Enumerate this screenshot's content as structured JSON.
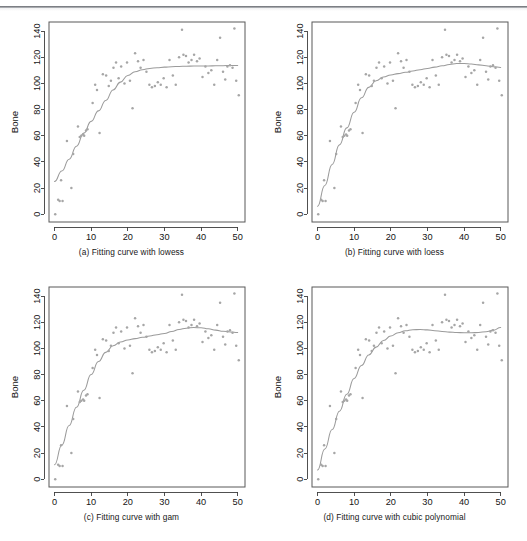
{
  "figure": {
    "panels": [
      {
        "id": "a",
        "caption": "(a) Fitting curve with lowess",
        "xlabel": "Age",
        "ylabel": "Bone",
        "method": "lowess"
      },
      {
        "id": "b",
        "caption": "(b) Fitting curve with loess",
        "xlabel": "Age",
        "ylabel": "Bone",
        "method": "loess"
      },
      {
        "id": "c",
        "caption": "(c) Fitting curve with gam",
        "xlabel": "Age",
        "ylabel": "Bone",
        "method": "gam"
      },
      {
        "id": "d",
        "caption": "(d) Fitting curve with cubic polynomial",
        "xlabel": "Age",
        "ylabel": "Bone",
        "method": "cubic polynomial"
      }
    ]
  },
  "chart_data": [
    {
      "type": "scatter",
      "title": "(a) Fitting curve with lowess",
      "xlabel": "Age",
      "ylabel": "Bone",
      "xlim": [
        -1.5,
        52
      ],
      "ylim": [
        -6,
        147
      ],
      "xticks": [
        0,
        10,
        20,
        30,
        40,
        50
      ],
      "yticks": [
        0,
        20,
        40,
        60,
        80,
        100,
        120,
        140
      ],
      "grid": false,
      "legend": "none",
      "point_color": "#a6a6a6",
      "curve_color": "#9b9b9b",
      "x": [
        0.2,
        1.0,
        1.4,
        1.8,
        2.2,
        3.4,
        4.6,
        5.1,
        6.4,
        6.9,
        7.3,
        7.8,
        8.1,
        8.6,
        9.0,
        10.4,
        11.1,
        11.6,
        12.3,
        13.2,
        14.1,
        14.8,
        15.4,
        16.1,
        16.8,
        17.5,
        18.2,
        19.1,
        19.8,
        20.6,
        21.3,
        22.0,
        22.8,
        23.5,
        24.3,
        25.1,
        25.9,
        26.6,
        27.4,
        28.2,
        29.0,
        29.8,
        30.6,
        31.4,
        32.3,
        33.1,
        34.0,
        34.8,
        35.2,
        35.9,
        36.6,
        37.4,
        38.1,
        38.9,
        39.6,
        40.4,
        41.2,
        42.0,
        42.8,
        43.6,
        44.4,
        45.2,
        46.0,
        46.6,
        47.2,
        47.9,
        48.6,
        49.1,
        49.6,
        50.3
      ],
      "y": [
        0,
        11,
        10,
        26,
        10,
        56,
        20,
        46,
        67,
        59,
        60,
        61,
        60,
        64,
        65,
        85,
        99,
        95,
        62,
        107,
        106,
        98,
        102,
        112,
        116,
        104,
        113,
        100,
        116,
        102,
        81,
        123,
        117,
        112,
        118,
        109,
        99,
        97,
        98,
        101,
        99,
        104,
        97,
        118,
        106,
        99,
        120,
        141,
        122,
        121,
        116,
        118,
        122,
        117,
        119,
        105,
        113,
        108,
        110,
        99,
        118,
        135,
        109,
        103,
        113,
        114,
        112,
        142,
        102,
        91
      ],
      "curve": {
        "name": "lowess fit",
        "x": [
          0,
          2,
          4,
          6,
          8,
          10,
          12,
          14,
          16,
          18,
          20,
          22,
          24,
          26,
          28,
          30,
          32,
          34,
          36,
          38,
          40,
          42,
          44,
          46,
          48,
          50
        ],
        "y": [
          25,
          33,
          42,
          52,
          62,
          71,
          79,
          87,
          95,
          101,
          106,
          109,
          110.5,
          111.5,
          112,
          112.5,
          112.8,
          113,
          113.2,
          113.3,
          113.3,
          113.4,
          113.5,
          113.6,
          113.7,
          113.8
        ]
      }
    },
    {
      "type": "scatter",
      "title": "(b) Fitting curve with loess",
      "xlabel": "Age",
      "ylabel": "Bone",
      "xlim": [
        -1.5,
        52
      ],
      "ylim": [
        -6,
        147
      ],
      "xticks": [
        0,
        10,
        20,
        30,
        40,
        50
      ],
      "yticks": [
        0,
        20,
        40,
        60,
        80,
        100,
        120,
        140
      ],
      "grid": false,
      "legend": "none",
      "point_color": "#a6a6a6",
      "curve_color": "#9b9b9b",
      "x": [
        0.2,
        1.0,
        1.4,
        1.8,
        2.2,
        3.4,
        4.6,
        5.1,
        6.4,
        6.9,
        7.3,
        7.8,
        8.1,
        8.6,
        9.0,
        10.4,
        11.1,
        11.6,
        12.3,
        13.2,
        14.1,
        14.8,
        15.4,
        16.1,
        16.8,
        17.5,
        18.2,
        19.1,
        19.8,
        20.6,
        21.3,
        22.0,
        22.8,
        23.5,
        24.3,
        25.1,
        25.9,
        26.6,
        27.4,
        28.2,
        29.0,
        29.8,
        30.6,
        31.4,
        32.3,
        33.1,
        34.0,
        34.8,
        35.2,
        35.9,
        36.6,
        37.4,
        38.1,
        38.9,
        39.6,
        40.4,
        41.2,
        42.0,
        42.8,
        43.6,
        44.4,
        45.2,
        46.0,
        46.6,
        47.2,
        47.9,
        48.6,
        49.1,
        49.6,
        50.3
      ],
      "y": [
        0,
        11,
        10,
        26,
        10,
        56,
        20,
        46,
        67,
        59,
        60,
        61,
        60,
        64,
        65,
        85,
        99,
        95,
        62,
        107,
        106,
        98,
        102,
        112,
        116,
        104,
        113,
        100,
        116,
        102,
        81,
        123,
        117,
        112,
        118,
        109,
        99,
        97,
        98,
        101,
        99,
        104,
        97,
        118,
        106,
        99,
        120,
        141,
        122,
        121,
        116,
        118,
        122,
        117,
        119,
        105,
        113,
        108,
        110,
        99,
        118,
        135,
        109,
        103,
        113,
        114,
        112,
        142,
        102,
        91
      ],
      "curve": {
        "name": "loess fit",
        "x": [
          0,
          2,
          4,
          6,
          8,
          10,
          12,
          14,
          16,
          18,
          20,
          22,
          24,
          26,
          28,
          30,
          32,
          34,
          36,
          38,
          40,
          42,
          44,
          46,
          48,
          50
        ],
        "y": [
          6,
          22,
          38,
          53,
          66,
          78,
          89,
          97,
          102,
          105,
          106.5,
          107.5,
          108.5,
          109.5,
          110.5,
          111.5,
          112.5,
          113.5,
          114.5,
          115.2,
          115.2,
          114.8,
          114.2,
          113.5,
          112.8,
          112.2
        ]
      }
    },
    {
      "type": "scatter",
      "title": "(c) Fitting curve with gam",
      "xlabel": "Age",
      "ylabel": "Bone",
      "xlim": [
        -1.5,
        52
      ],
      "ylim": [
        -6,
        147
      ],
      "xticks": [
        0,
        10,
        20,
        30,
        40,
        50
      ],
      "yticks": [
        0,
        20,
        40,
        60,
        80,
        100,
        120,
        140
      ],
      "grid": false,
      "legend": "none",
      "point_color": "#a6a6a6",
      "curve_color": "#9b9b9b",
      "x": [
        0.2,
        1.0,
        1.4,
        1.8,
        2.2,
        3.4,
        4.6,
        5.1,
        6.4,
        6.9,
        7.3,
        7.8,
        8.1,
        8.6,
        9.0,
        10.4,
        11.1,
        11.6,
        12.3,
        13.2,
        14.1,
        14.8,
        15.4,
        16.1,
        16.8,
        17.5,
        18.2,
        19.1,
        19.8,
        20.6,
        21.3,
        22.0,
        22.8,
        23.5,
        24.3,
        25.1,
        25.9,
        26.6,
        27.4,
        28.2,
        29.0,
        29.8,
        30.6,
        31.4,
        32.3,
        33.1,
        34.0,
        34.8,
        35.2,
        35.9,
        36.6,
        37.4,
        38.1,
        38.9,
        39.6,
        40.4,
        41.2,
        42.0,
        42.8,
        43.6,
        44.4,
        45.2,
        46.0,
        46.6,
        47.2,
        47.9,
        48.6,
        49.1,
        49.6,
        50.3
      ],
      "y": [
        0,
        11,
        10,
        26,
        10,
        56,
        20,
        46,
        67,
        59,
        60,
        61,
        60,
        64,
        65,
        85,
        99,
        95,
        62,
        107,
        106,
        98,
        102,
        112,
        116,
        104,
        113,
        100,
        116,
        102,
        81,
        123,
        117,
        112,
        118,
        109,
        99,
        97,
        98,
        101,
        99,
        104,
        97,
        118,
        106,
        99,
        120,
        141,
        122,
        121,
        116,
        118,
        122,
        117,
        119,
        105,
        113,
        108,
        110,
        99,
        118,
        135,
        109,
        103,
        113,
        114,
        112,
        142,
        102,
        91
      ],
      "curve": {
        "name": "gam fit",
        "x": [
          0,
          2,
          4,
          6,
          8,
          10,
          12,
          14,
          16,
          18,
          20,
          22,
          24,
          26,
          28,
          30,
          32,
          34,
          36,
          38,
          40,
          42,
          44,
          46,
          48,
          50
        ],
        "y": [
          11,
          26,
          41,
          55,
          68,
          80,
          90,
          97,
          102,
          105,
          106.5,
          107.5,
          108.5,
          109.5,
          110.5,
          111.5,
          113,
          114.5,
          115.5,
          116,
          115.8,
          115,
          114,
          113.2,
          112.6,
          112.2
        ]
      }
    },
    {
      "type": "scatter",
      "title": "(d) Fitting curve with cubic polynomial",
      "xlabel": "Age",
      "ylabel": "Bone",
      "xlim": [
        -1.5,
        52
      ],
      "ylim": [
        -6,
        147
      ],
      "xticks": [
        0,
        10,
        20,
        30,
        40,
        50
      ],
      "yticks": [
        0,
        20,
        40,
        60,
        80,
        100,
        120,
        140
      ],
      "grid": false,
      "legend": "none",
      "point_color": "#a6a6a6",
      "curve_color": "#9b9b9b",
      "x": [
        0.2,
        1.0,
        1.4,
        1.8,
        2.2,
        3.4,
        4.6,
        5.1,
        6.4,
        6.9,
        7.3,
        7.8,
        8.1,
        8.6,
        9.0,
        10.4,
        11.1,
        11.6,
        12.3,
        13.2,
        14.1,
        14.8,
        15.4,
        16.1,
        16.8,
        17.5,
        18.2,
        19.1,
        19.8,
        20.6,
        21.3,
        22.0,
        22.8,
        23.5,
        24.3,
        25.1,
        25.9,
        26.6,
        27.4,
        28.2,
        29.0,
        29.8,
        30.6,
        31.4,
        32.3,
        33.1,
        34.0,
        34.8,
        35.2,
        35.9,
        36.6,
        37.4,
        38.1,
        38.9,
        39.6,
        40.4,
        41.2,
        42.0,
        42.8,
        43.6,
        44.4,
        45.2,
        46.0,
        46.6,
        47.2,
        47.9,
        48.6,
        49.1,
        49.6,
        50.3
      ],
      "y": [
        0,
        11,
        10,
        26,
        10,
        56,
        20,
        46,
        67,
        59,
        60,
        61,
        60,
        64,
        65,
        85,
        99,
        95,
        62,
        107,
        106,
        98,
        102,
        112,
        116,
        104,
        113,
        100,
        116,
        102,
        81,
        123,
        117,
        112,
        118,
        109,
        99,
        97,
        98,
        101,
        99,
        104,
        97,
        118,
        106,
        99,
        120,
        141,
        122,
        121,
        116,
        118,
        122,
        117,
        119,
        105,
        113,
        108,
        110,
        99,
        118,
        135,
        109,
        103,
        113,
        114,
        112,
        142,
        102,
        91
      ],
      "curve": {
        "name": "cubic polynomial fit",
        "x": [
          0,
          2,
          4,
          6,
          8,
          10,
          12,
          14,
          16,
          18,
          20,
          22,
          24,
          26,
          28,
          30,
          32,
          34,
          36,
          38,
          40,
          42,
          44,
          46,
          48,
          50
        ],
        "y": [
          7,
          23,
          38,
          52,
          65,
          77,
          87,
          95,
          101,
          106,
          109.5,
          112,
          113.5,
          114.3,
          114.5,
          114.2,
          113.6,
          113,
          112.5,
          112.2,
          112,
          112,
          112.2,
          112.8,
          114,
          116
        ]
      }
    }
  ]
}
